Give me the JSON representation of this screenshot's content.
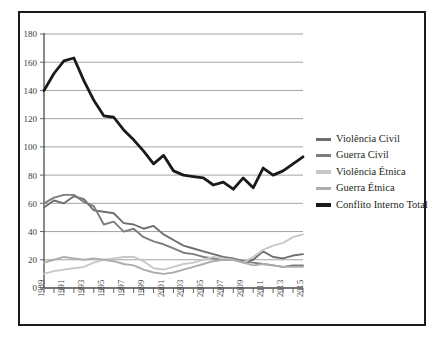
{
  "chart_data": {
    "type": "line",
    "title": "",
    "subtitle": "",
    "xlabel": "",
    "ylabel": "",
    "grid": true,
    "legend_position": "right",
    "xlim": [
      1989,
      2015
    ],
    "ylim": [
      0,
      180
    ],
    "ytick_step": 20,
    "yticks": [
      0,
      20,
      40,
      60,
      80,
      100,
      120,
      140,
      160,
      180
    ],
    "xticks": [
      1989,
      1991,
      1993,
      1995,
      1997,
      1999,
      2001,
      2003,
      2005,
      2007,
      2009,
      2011,
      2013,
      2015
    ],
    "x": [
      1989,
      1990,
      1991,
      1992,
      1993,
      1994,
      1995,
      1996,
      1997,
      1998,
      1999,
      2000,
      2001,
      2002,
      2003,
      2004,
      2005,
      2006,
      2007,
      2008,
      2009,
      2010,
      2011,
      2012,
      2013,
      2014,
      2015
    ],
    "categories": [
      "1989",
      "1990",
      "1991",
      "1992",
      "1993",
      "1994",
      "1995",
      "1996",
      "1997",
      "1998",
      "1999",
      "2000",
      "2001",
      "2002",
      "2003",
      "2004",
      "2005",
      "2006",
      "2007",
      "2008",
      "2009",
      "2010",
      "2011",
      "2012",
      "2013",
      "2014",
      "2015"
    ],
    "series": [
      {
        "name": "Violência Civil",
        "color": "#6e6e6e",
        "width": 1.9,
        "values": [
          57,
          62,
          60,
          65,
          63,
          55,
          54,
          53,
          46,
          45,
          42,
          44,
          38,
          34,
          30,
          28,
          26,
          24,
          22,
          21,
          19,
          20,
          26,
          22,
          21,
          23,
          24
        ]
      },
      {
        "name": "Guerra Civil",
        "color": "#7d7d7d",
        "width": 1.9,
        "values": [
          60,
          64,
          66,
          66,
          61,
          58,
          45,
          47,
          40,
          42,
          36,
          33,
          31,
          28,
          25,
          24,
          22,
          21,
          20,
          20,
          19,
          18,
          17,
          16,
          15,
          16,
          16
        ]
      },
      {
        "name": "Violência Étnica",
        "color": "#c8c8c8",
        "width": 1.9,
        "values": [
          10,
          12,
          13,
          14,
          15,
          18,
          20,
          21,
          22,
          22,
          19,
          14,
          13,
          15,
          17,
          18,
          20,
          22,
          21,
          20,
          18,
          22,
          27,
          30,
          32,
          36,
          38
        ]
      },
      {
        "name": "Guerra Étnica",
        "color": "#adadad",
        "width": 1.9,
        "values": [
          18,
          20,
          22,
          21,
          20,
          21,
          20,
          19,
          17,
          16,
          13,
          11,
          10,
          11,
          13,
          15,
          17,
          19,
          20,
          20,
          18,
          16,
          17,
          16,
          15,
          15,
          15
        ]
      },
      {
        "name": "Conflito Interno Total",
        "color": "#1a1a1a",
        "width": 2.8,
        "values": [
          140,
          152,
          161,
          163,
          147,
          133,
          122,
          121,
          112,
          105,
          97,
          88,
          94,
          83,
          80,
          79,
          78,
          73,
          75,
          70,
          78,
          71,
          85,
          80,
          83,
          88,
          93
        ]
      }
    ]
  },
  "legend": {
    "items": [
      {
        "label": "Violência Civil"
      },
      {
        "label": "Guerra Civil"
      },
      {
        "label": "Violência Étnica"
      },
      {
        "label": "Guerra Étnica"
      },
      {
        "label": "Conflito Interno Total"
      }
    ]
  }
}
